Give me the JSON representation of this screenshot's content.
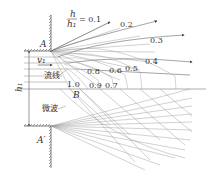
{
  "diagram": {
    "points": {
      "A": "A",
      "A_prime": "A′",
      "B": "B"
    },
    "ratio_label": {
      "numerator": "h",
      "denominator": "h₁",
      "equals": "= 0.1"
    },
    "contour_labels": [
      "0.2",
      "0.3",
      "0.4",
      "0.5",
      "0.6",
      "0.8",
      "1.0",
      "0.9",
      "0.7"
    ],
    "velocity_label": "v₁",
    "streamline_label": "流线",
    "wave_label": "微波",
    "height_label": "h₁"
  }
}
